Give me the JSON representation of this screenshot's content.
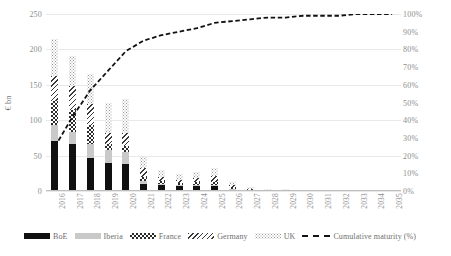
{
  "chart_data": {
    "type": "bar",
    "subtype": "stacked-bar-with-cumulative-line",
    "title": "",
    "xlabel": "",
    "ylabel": "€ bn",
    "y2label": "",
    "ylim": [
      0,
      250
    ],
    "y2lim": [
      0,
      100
    ],
    "grid": true,
    "legend_position": "bottom",
    "categories": [
      "2016",
      "2017",
      "2018",
      "2019",
      "2020",
      "2021",
      "2022",
      "2023",
      "2024",
      "2025",
      "2026",
      "2027",
      "2028",
      "2029",
      "2030",
      "2031",
      "2032",
      "2033",
      "2034",
      "2035"
    ],
    "y_ticks": [
      0,
      50,
      100,
      150,
      200,
      250
    ],
    "y2_ticks": [
      "0%",
      "10%",
      "20%",
      "30%",
      "40%",
      "50%",
      "60%",
      "70%",
      "80%",
      "90%",
      "100%"
    ],
    "series": [
      {
        "name": "BoE",
        "pattern": "solid-black",
        "values": [
          70,
          66,
          47,
          39,
          38,
          10,
          8,
          7,
          7,
          7,
          2,
          0,
          0,
          0,
          0,
          0,
          0,
          0,
          0,
          0
        ]
      },
      {
        "name": "Iberia",
        "pattern": "light-gray",
        "values": [
          23,
          18,
          20,
          19,
          17,
          4,
          2,
          2,
          2,
          2,
          1,
          0,
          0,
          0,
          0,
          0,
          0,
          0,
          0,
          0
        ]
      },
      {
        "name": "France",
        "pattern": "checkerboard",
        "values": [
          34,
          30,
          26,
          8,
          9,
          6,
          4,
          3,
          4,
          4,
          2,
          1,
          0,
          0,
          0,
          0,
          0,
          0,
          0,
          0
        ]
      },
      {
        "name": "Germany",
        "pattern": "diagonal-hatch",
        "values": [
          36,
          34,
          30,
          16,
          18,
          13,
          6,
          4,
          5,
          8,
          3,
          2,
          1,
          1,
          1,
          0,
          0,
          0,
          0,
          0
        ]
      },
      {
        "name": "UK",
        "pattern": "fine-dotted",
        "values": [
          52,
          43,
          43,
          42,
          48,
          15,
          10,
          8,
          9,
          12,
          5,
          3,
          2,
          2,
          1,
          0,
          0,
          0,
          0,
          0
        ]
      }
    ],
    "line_series": {
      "name": "Cumulative maturity (%)",
      "style": "dashed-black",
      "axis": "right",
      "values": [
        25,
        42,
        57,
        68,
        79,
        85,
        88,
        90,
        92,
        95,
        96,
        97,
        98,
        98,
        99,
        99,
        99,
        100,
        100,
        100
      ]
    }
  },
  "legend": {
    "items": [
      {
        "label": "BoE"
      },
      {
        "label": "Iberia"
      },
      {
        "label": "France"
      },
      {
        "label": "Germany"
      },
      {
        "label": "UK"
      },
      {
        "label": "Cumulative maturity (%)"
      }
    ]
  }
}
